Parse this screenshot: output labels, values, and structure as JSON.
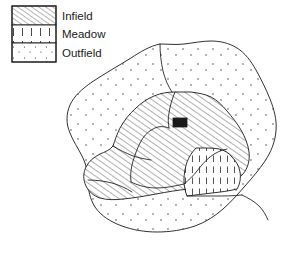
{
  "figure": {
    "kind": "land-use-map",
    "caption": "",
    "background_color": "#ffffff",
    "line_color": "#1a1a1a"
  },
  "legend": {
    "name": "map-legend",
    "box": {
      "x": 12,
      "y": 6,
      "width": 44,
      "height": 56
    },
    "items": [
      {
        "key": "infield",
        "label": "Infield",
        "pattern": "diagonal-hatch",
        "swatch": {
          "x": 12,
          "y": 6,
          "width": 44,
          "height": 19
        },
        "label_x": 62,
        "label_y": 16
      },
      {
        "key": "meadow",
        "label": "Meadow",
        "pattern": "vertical-dash",
        "swatch": {
          "x": 12,
          "y": 25,
          "width": 44,
          "height": 18
        },
        "label_x": 62,
        "label_y": 35
      },
      {
        "key": "outfield",
        "label": "Outfield",
        "pattern": "stipple",
        "swatch": {
          "x": 12,
          "y": 43,
          "width": 44,
          "height": 19
        },
        "label_x": 62,
        "label_y": 53
      }
    ]
  },
  "map": {
    "name": "field-system-map",
    "regions": [
      {
        "key": "outfield",
        "name": "outfield-region",
        "pattern": "stipple",
        "path": "M 160 44 C 150 46 140 52 131 58 C 118 66 104 74 92 82 C 82 89 74 96 70 105 C 66 114 66 124 70 133 C 73 141 78 148 82 156 C 86 164 88 172 88 180 C 88 190 90 199 95 207 C 101 216 111 222 122 226 C 133 230 145 232 157 232 C 170 232 183 230 195 226 C 206 222 215 216 223 209 C 231 202 238 194 245 186 C 252 178 259 170 265 161 C 271 152 275 142 276 131 C 277 120 274 109 270 99 C 266 89 261 79 256 70 C 251 61 245 53 237 48 C 229 43 220 41 211 41 C 202 41 193 43 184 44 C 176 45 168 44 160 44 Z"
      },
      {
        "key": "infield",
        "name": "infield-region",
        "pattern": "diagonal-hatch",
        "path": "M 175 92 C 168 92 161 93 154 96 C 147 99 141 103 136 108 C 129 114 124 121 120 128 C 117 134 115 140 113 146 C 110 150 105 152 100 154 C 94 157 89 161 86 167 C 83 173 83 180 86 186 C 89 192 94 196 100 198 C 107 200 115 200 123 199 C 134 198 145 196 156 194 C 167 192 178 190 189 189 C 200 188 211 188 221 186 C 230 184 238 180 243 174 C 248 168 250 160 249 152 C 248 144 245 137 241 130 C 237 123 232 117 227 111 C 222 105 217 100 211 97 C 205 94 198 93 191 92 C 186 92 180 92 175 92 Z"
      },
      {
        "key": "meadow",
        "name": "meadow-region",
        "pattern": "vertical-dash",
        "path": "M 196 148 C 192 152 189 157 187 162 C 185 168 184 174 184 180 C 184 186 185 191 187 196 C 195 195 204 194 212 193 C 221 192 229 191 237 189 C 240 184 241 178 240 172 C 239 166 236 161 232 157 C 229 153 224 150 219 149 C 214 148 208 148 203 148 C 201 148 198 148 196 148 Z"
      }
    ],
    "interior_boundaries": [
      "M 175 92 C 172 99 170 106 169 113 C 168 118 168 123 169 128",
      "M 169 128 C 164 126 158 126 153 129 C 147 132 143 137 140 143 C 137 149 135 155 133 161 C 131 168 130 175 131 182",
      "M 131 182 C 139 186 148 188 157 188 C 166 188 175 186 184 184",
      "M 184 184 C 189 180 193 176 197 171 C 201 166 205 161 210 157 C 215 153 221 150 227 149",
      "M 113 146 C 119 150 126 153 133 156 C 139 158 145 159 151 160",
      "M 160 44 C 160 53 161 62 163 71 C 165 79 168 86 172 92",
      "M 187 196 C 196 196 206 196 215 196 C 224 196 233 196 242 195",
      "M 242 195 C 248 198 254 201 259 206 C 263 210 266 215 268 220",
      "M 88 180 C 96 180 104 181 112 183 C 119 185 126 188 132 192"
    ],
    "building": {
      "name": "building-marker",
      "x": 173,
      "y": 118,
      "width": 14,
      "height": 9,
      "color": "#1a1a1a"
    }
  }
}
